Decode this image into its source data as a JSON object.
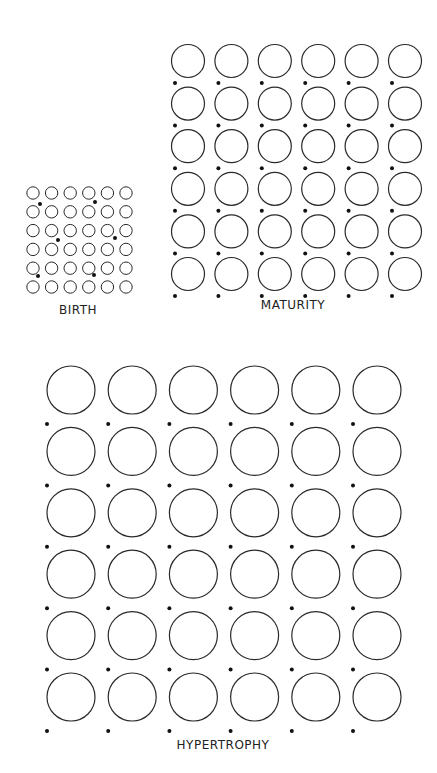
{
  "colors": {
    "stroke": "#2a2a2a",
    "dot": "#111111",
    "background": "#ffffff",
    "text": "#222222"
  },
  "panels": [
    {
      "id": "birth",
      "label": "BIRTH",
      "label_pos": {
        "x": 78,
        "y": 311
      },
      "rows": 6,
      "cols": 6,
      "origin": {
        "x": 33,
        "y": 193
      },
      "spacing": {
        "x": 18.6,
        "y": 18.8
      },
      "radius": 6.2,
      "dots": [
        {
          "x": 40,
          "y": 204
        },
        {
          "x": 95,
          "y": 202
        },
        {
          "x": 58,
          "y": 240
        },
        {
          "x": 115,
          "y": 238
        },
        {
          "x": 38,
          "y": 276
        },
        {
          "x": 94,
          "y": 275
        }
      ]
    },
    {
      "id": "maturity",
      "label": "MATURITY",
      "label_pos": {
        "x": 293,
        "y": 306
      },
      "rows": 6,
      "cols": 6,
      "origin": {
        "x": 188,
        "y": 61
      },
      "spacing": {
        "x": 43.4,
        "y": 42.6
      },
      "radius": 16.5,
      "dot_offset": {
        "x": -13,
        "y": 22
      },
      "dot_rows": 6
    },
    {
      "id": "hypertrophy",
      "label": "HYPERTROPHY",
      "label_pos": {
        "x": 223,
        "y": 746
      },
      "rows": 6,
      "cols": 6,
      "origin": {
        "x": 71,
        "y": 390
      },
      "spacing": {
        "x": 61.2,
        "y": 61.4
      },
      "radius": 24,
      "dot_offset": {
        "x": -24,
        "y": 34
      },
      "dot_rows": 6
    }
  ]
}
